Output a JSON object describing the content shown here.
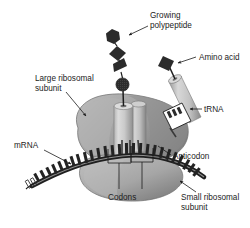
{
  "figure": {
    "background_color": "#ffffff",
    "line_color": "#1c1c1c"
  },
  "labels": {
    "growing_polypeptide_line1": "Growing",
    "growing_polypeptide_line2": "polypeptide",
    "amino_acid": "Amino acid",
    "large_subunit_line1": "Large ribosomal",
    "large_subunit_line2": "subunit",
    "trna": "tRNA",
    "mrna": "mRNA",
    "anticodon": "Anticodon",
    "codons": "Codons",
    "small_subunit_line1": "Small ribosomal",
    "small_subunit_line2": "subunit"
  },
  "structures": {
    "large_subunit_name": "large-ribosomal-subunit",
    "small_subunit_name": "small-ribosomal-subunit",
    "mrna_strand_name": "mrna-strand",
    "trna_incoming_name": "trna-incoming",
    "trna_bound_name": "trna-bound",
    "polypeptide_chain_name": "polypeptide-chain"
  },
  "colors": {
    "subunit_light": "#b9b9b9",
    "subunit_mid": "#9a9a9a",
    "subunit_dark": "#6f6f6f",
    "cylinder_light": "#d2d2d2",
    "cylinder_shade": "#a8a8a8",
    "dark_shape": "#2b2b2b",
    "mrna_dark": "#232323",
    "outline": "#1c1c1c"
  },
  "chain_shapes": [
    {
      "name": "hexagon-residue",
      "order": 1
    },
    {
      "name": "diamond-residue",
      "order": 2
    },
    {
      "name": "triangle-residue",
      "order": 3
    },
    {
      "name": "textured-circle-residue",
      "order": 4
    }
  ],
  "mrna_codon_count": 3
}
